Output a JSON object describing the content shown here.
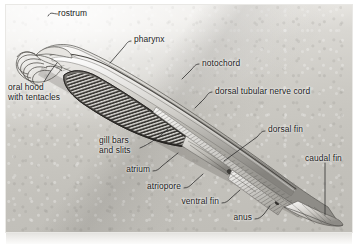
{
  "figure": {
    "style": "grayscale-pencil-illustration",
    "colors": {
      "ground_light": "#f3f2f0",
      "ground_mid": "#cbc9c3",
      "ground_dark": "#bfbdb7",
      "body_fill": "#cdcbc6",
      "body_shadow": "#6f6d69",
      "ink": "#1b1b1b",
      "leader_line": "#2a2a2a",
      "page": "#ffffff"
    },
    "labels": [
      {
        "id": "rostrum",
        "text": "rostrum",
        "x": 58,
        "y": 8,
        "align": "left"
      },
      {
        "id": "pharynx",
        "text": "pharynx",
        "x": 134,
        "y": 34,
        "align": "left"
      },
      {
        "id": "notochord",
        "text": "notochord",
        "x": 202,
        "y": 58,
        "align": "left"
      },
      {
        "id": "oral-hood",
        "text": "oral hood\nwith tentacles",
        "x": 8,
        "y": 82,
        "align": "left"
      },
      {
        "id": "dorsal-nerve-cord",
        "text": "dorsal tubular nerve cord",
        "x": 215,
        "y": 86,
        "align": "left"
      },
      {
        "id": "dorsal-fin",
        "text": "dorsal fin",
        "x": 268,
        "y": 124,
        "align": "left"
      },
      {
        "id": "gill-bars",
        "text": "gill bars\nand slits",
        "x": 99,
        "y": 135,
        "align": "left"
      },
      {
        "id": "caudal-fin",
        "text": "caudal fin",
        "x": 305,
        "y": 153,
        "align": "left"
      },
      {
        "id": "atrium",
        "text": "atrium",
        "x": 150,
        "y": 164,
        "align": "right"
      },
      {
        "id": "atriopore",
        "text": "atriopore",
        "x": 181,
        "y": 181,
        "align": "right"
      },
      {
        "id": "ventral-fin",
        "text": "ventral fin",
        "x": 219,
        "y": 196,
        "align": "right"
      },
      {
        "id": "anus",
        "text": "anus",
        "x": 252,
        "y": 212,
        "align": "right"
      }
    ],
    "leaders": [
      {
        "id": "leader-rostrum",
        "d": "M 55 14 C 49 14, 47 11, 45 16"
      },
      {
        "id": "leader-pharynx",
        "d": "M 131 40 C 127 40, 126 44, 123 47 L 110 61"
      },
      {
        "id": "leader-notochord",
        "d": "M 199 64 C 195 64, 194 67, 191 70 L 183 78"
      },
      {
        "id": "leader-oral-hood",
        "d": "M 44 80 C 48 73, 52 66, 57 60"
      },
      {
        "id": "leader-nerve-cord",
        "d": "M 212 92 C 208 92, 207 96, 204 99 L 196 107"
      },
      {
        "id": "leader-dorsal-fin",
        "d": "M 265 130 C 261 130, 260 133, 257 136 L 224 160"
      },
      {
        "id": "leader-gill-bars",
        "d": "M 140 146 C 150 142, 160 134, 168 127"
      },
      {
        "id": "leader-caudal-fin",
        "d": "M 325 161 L 325 213"
      },
      {
        "id": "leader-atrium",
        "d": "M 153 170 C 157 170, 159 168, 162 165 L 178 152"
      },
      {
        "id": "leader-atriopore",
        "d": "M 184 187 C 188 187, 190 185, 193 182 L 203 173"
      },
      {
        "id": "leader-ventral-fin",
        "d": "M 222 202 C 226 202, 228 200, 231 197 L 240 189"
      },
      {
        "id": "leader-anus",
        "d": "M 255 218 C 259 218, 261 216, 264 213 L 270 205"
      }
    ],
    "structures": [
      "rostrum",
      "oral hood with tentacles",
      "pharynx",
      "gill bars and slits",
      "notochord",
      "dorsal tubular nerve cord",
      "atrium",
      "atriopore",
      "ventral fin",
      "dorsal fin",
      "anus",
      "caudal fin"
    ]
  }
}
